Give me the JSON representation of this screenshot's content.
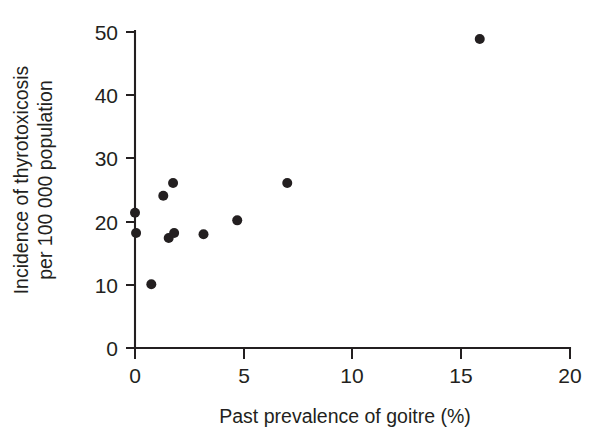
{
  "chart_data": {
    "type": "scatter",
    "title": "",
    "subtitle": "",
    "xlabel": "Past prevalence of goitre (%)",
    "ylabel_line1": "Incidence of thyrotoxicosis",
    "ylabel_line2": "per 100 000 population",
    "ylabel": "Incidence of thyrotoxicosis per 100 000 population",
    "xlim": [
      0,
      20
    ],
    "ylim": [
      0,
      50
    ],
    "xticks": [
      0,
      5,
      10,
      15,
      20
    ],
    "xtick_labels": [
      "0",
      "5",
      "10",
      "15",
      "20"
    ],
    "yticks": [
      0,
      10,
      20,
      30,
      40,
      50
    ],
    "ytick_labels": [
      "0",
      "10",
      "20",
      "30",
      "40",
      "50"
    ],
    "grid": false,
    "legend": null,
    "legend_position": "none",
    "marker": "filled-circle",
    "marker_color": "#231f20",
    "marker_size_px": 10,
    "n_points": 11,
    "points": [
      {
        "x": 0.0,
        "y": 21.4
      },
      {
        "x": 0.05,
        "y": 18.2
      },
      {
        "x": 0.75,
        "y": 10.1
      },
      {
        "x": 1.3,
        "y": 24.1
      },
      {
        "x": 1.55,
        "y": 17.4
      },
      {
        "x": 1.75,
        "y": 26.1
      },
      {
        "x": 1.8,
        "y": 18.2
      },
      {
        "x": 3.15,
        "y": 18.0
      },
      {
        "x": 4.7,
        "y": 20.2
      },
      {
        "x": 7.0,
        "y": 26.1
      },
      {
        "x": 15.85,
        "y": 48.9
      }
    ]
  },
  "figure": {
    "background_color": "#ffffff",
    "axis_color": "#231f20"
  }
}
